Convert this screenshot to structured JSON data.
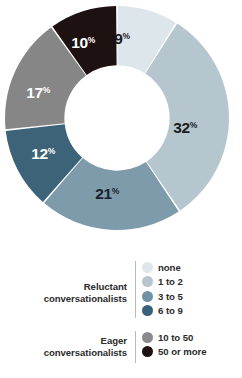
{
  "chart_data": {
    "type": "pie",
    "variant": "donut",
    "title": "",
    "subtitle": "",
    "xlabel": "",
    "ylabel": "",
    "grid": false,
    "legend_position": "bottom",
    "start_angle_deg": 0,
    "direction": "clockwise",
    "inner_radius_ratio": 0.47,
    "categories": [
      "none",
      "1 to 2",
      "3 to 5",
      "6 to 9",
      "10 to 50",
      "50 or more"
    ],
    "values": [
      9,
      32,
      21,
      12,
      17,
      10
    ],
    "value_suffix": "%",
    "data_labels": [
      "9%",
      "32%",
      "21%",
      "12%",
      "17%",
      "10%"
    ],
    "slices": [
      {
        "label": "none",
        "value": 9,
        "data_label_number": "9",
        "data_label_suffix": "%",
        "color": "#dde6ea",
        "text_color": "#1b1b1b",
        "group": "Reluctant conversationalists",
        "label_x": 122,
        "label_y": 44
      },
      {
        "label": "1 to 2",
        "value": 32,
        "data_label_number": "32",
        "data_label_suffix": "%",
        "color": "#b6c6cf",
        "text_color": "#1b1b1b",
        "group": "Reluctant conversationalists",
        "label_x": 185,
        "label_y": 133
      },
      {
        "label": "3 to 5",
        "value": 21,
        "data_label_number": "21",
        "data_label_suffix": "%",
        "color": "#7d9bab",
        "text_color": "#19222b",
        "group": "Reluctant conversationalists",
        "label_x": 107,
        "label_y": 199
      },
      {
        "label": "6 to 9",
        "value": 12,
        "data_label_number": "12",
        "data_label_suffix": "%",
        "color": "#3c6378",
        "text_color": "#ffffff",
        "group": "Reluctant conversationalists",
        "label_x": 43,
        "label_y": 159
      },
      {
        "label": "10 to 50",
        "value": 17,
        "data_label_number": "17",
        "data_label_suffix": "%",
        "color": "#868686",
        "text_color": "#ffffff",
        "group": "Eager conversationalists",
        "label_x": 38,
        "label_y": 98
      },
      {
        "label": "50 or more",
        "value": 10,
        "data_label_number": "10",
        "data_label_suffix": "%",
        "color": "#1d1111",
        "text_color": "#ffffff",
        "group": "Eager conversationalists",
        "label_x": 83,
        "label_y": 48
      }
    ],
    "legend": {
      "groups": [
        {
          "name": "reluctant",
          "label_lines": [
            "Reluctant",
            "conversationalists"
          ],
          "items": [
            {
              "label": "none",
              "color": "#dde6ea"
            },
            {
              "label": "1 to 2",
              "color": "#b6c6cf"
            },
            {
              "label": "3 to 5",
              "color": "#6f93a6"
            },
            {
              "label": "6 to 9",
              "color": "#376178"
            }
          ]
        },
        {
          "name": "eager",
          "label_lines": [
            "Eager",
            "conversationalists"
          ],
          "items": [
            {
              "label": "10 to 50",
              "color": "#8a8a8a"
            },
            {
              "label": "50 or more",
              "color": "#1d1111"
            }
          ]
        }
      ]
    }
  }
}
